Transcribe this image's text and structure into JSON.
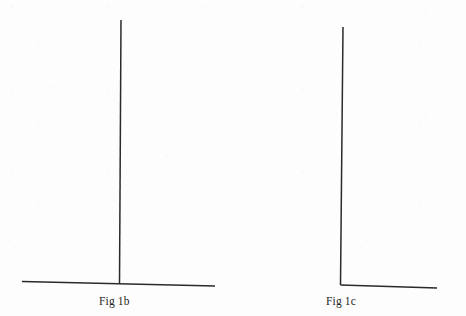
{
  "document": {
    "type": "scanned-line-drawing",
    "background_color": "#fdfdfd",
    "ink_color": "#2a2a2a",
    "width": 466,
    "height": 316
  },
  "figures": [
    {
      "id": "fig-1b",
      "caption": "Fig 1b",
      "shape_name": "inverted-t-shape",
      "caption_position": {
        "x": 99,
        "y": 295
      },
      "strokes": [
        {
          "name": "vertical-stem",
          "orientation": "vertical",
          "x1": 121,
          "y1": 20,
          "x2": 119.5,
          "y2": 284,
          "width": 1.5
        },
        {
          "name": "horizontal-base",
          "orientation": "horizontal",
          "x1": 22,
          "y1": 281.5,
          "x2": 215,
          "y2": 286,
          "width": 1.5
        }
      ]
    },
    {
      "id": "fig-1c",
      "caption": "Fig 1c",
      "shape_name": "l-shape",
      "caption_position": {
        "x": 326,
        "y": 295
      },
      "strokes": [
        {
          "name": "vertical-stem",
          "orientation": "vertical",
          "x1": 343,
          "y1": 27,
          "x2": 340.5,
          "y2": 285,
          "width": 1.5
        },
        {
          "name": "horizontal-base",
          "orientation": "horizontal",
          "x1": 340.5,
          "y1": 285,
          "x2": 437,
          "y2": 288,
          "width": 1.5
        }
      ]
    }
  ]
}
